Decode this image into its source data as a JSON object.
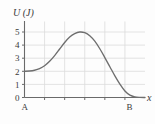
{
  "figure": {
    "width": 155,
    "height": 124,
    "background_color": "#fdfdfd"
  },
  "style": {
    "curve_color": "#6e6e6e",
    "axis_color": "#6a6a6a",
    "grid_color": "#dcdcdc",
    "text_color": "#3a3a3a"
  },
  "chart_data": {
    "type": "line",
    "title": "",
    "ylabel": "U (J)",
    "xlabel": "x",
    "xlim": [
      0,
      6
    ],
    "ylim": [
      0,
      5.6
    ],
    "grid": true,
    "legend": null,
    "y_ticks": [
      0,
      1,
      2,
      3,
      4,
      5
    ],
    "y_tick_labels": [
      "0",
      "1",
      "2",
      "3",
      "4",
      "5"
    ],
    "x_ticks": [
      1,
      2,
      3,
      4,
      5
    ],
    "x_tick_labels": [
      "",
      "",
      "",
      "",
      ""
    ],
    "x_axis_endpoint_labels": [
      {
        "name": "A",
        "x": 0
      },
      {
        "name": "B",
        "x": 5
      }
    ],
    "series": [
      {
        "name": "U(x)",
        "x": [
          0.0,
          0.25,
          0.5,
          0.75,
          1.0,
          1.25,
          1.5,
          1.75,
          2.0,
          2.25,
          2.5,
          2.75,
          3.0,
          3.25,
          3.5,
          3.75,
          4.0,
          4.25,
          4.5,
          4.75,
          5.0,
          5.25,
          5.5,
          5.75,
          6.0
        ],
        "y": [
          2.0,
          2.02,
          2.08,
          2.2,
          2.42,
          2.76,
          3.2,
          3.7,
          4.2,
          4.62,
          4.88,
          5.0,
          4.95,
          4.72,
          4.3,
          3.72,
          3.05,
          2.35,
          1.65,
          1.02,
          0.5,
          0.18,
          0.05,
          0.01,
          0.0
        ]
      }
    ],
    "annotations": [
      {
        "label": "peak",
        "x": 2.75,
        "y": 5.0
      },
      {
        "label": "start",
        "x": 0.0,
        "y": 2.0
      },
      {
        "label": "end",
        "x": 5.0,
        "y": 0.5
      }
    ]
  },
  "labels": {
    "y_axis": "U (J)",
    "x_axis": "x",
    "point_a": "A",
    "point_b": "B"
  }
}
